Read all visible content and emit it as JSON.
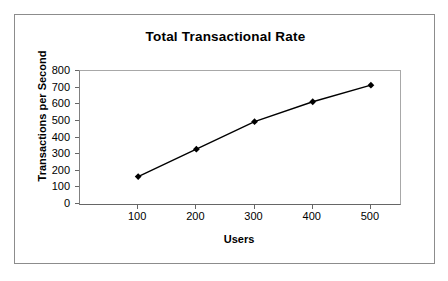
{
  "chart_data": {
    "type": "line",
    "title": "Total Transactional Rate",
    "xlabel": "Users",
    "ylabel": "Transactions per Second",
    "x": [
      100,
      200,
      300,
      400,
      500
    ],
    "values": [
      165,
      330,
      495,
      615,
      715
    ],
    "series": [
      {
        "name": "Total Transactional Rate",
        "values": [
          165,
          330,
          495,
          615,
          715
        ]
      }
    ],
    "xlim": [
      0,
      550
    ],
    "ylim": [
      0,
      800
    ],
    "xticks": [
      100,
      200,
      300,
      400,
      500
    ],
    "yticks": [
      0,
      100,
      200,
      300,
      400,
      500,
      600,
      700,
      800
    ],
    "xtick_labels": [
      "100",
      "200",
      "300",
      "400",
      "500"
    ],
    "ytick_labels": [
      "0",
      "100",
      "200",
      "300",
      "400",
      "500",
      "600",
      "700",
      "800"
    ],
    "grid": false,
    "legend": false,
    "legend_position": "none",
    "marker": "diamond",
    "marker_color": "#000000",
    "line_color": "#000000",
    "plot_background": "#ffffff",
    "frame_color": "#8c8c8c",
    "axis_color": "#666666"
  }
}
